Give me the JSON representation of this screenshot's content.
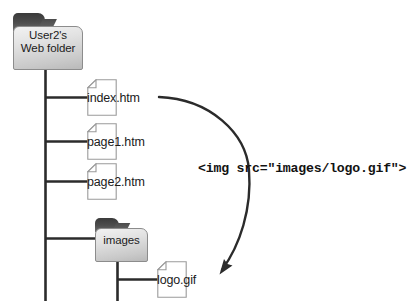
{
  "diagram": {
    "background_color": "#ffffff",
    "line_color": "#2b2b2b",
    "file_outline_color": "#9a9a9a",
    "folder_tab_color": "#4e4e4e",
    "folder_body_color": "#dcdcdc"
  },
  "root_folder": {
    "icon": "folder-icon",
    "label_line1": "User2's",
    "label_line2": "Web folder"
  },
  "files": [
    {
      "icon": "file-icon",
      "label": "index.htm"
    },
    {
      "icon": "file-icon",
      "label": "page1.htm"
    },
    {
      "icon": "file-icon",
      "label": "page2.htm"
    }
  ],
  "images_folder": {
    "icon": "folder-icon",
    "label": "images"
  },
  "image_file": {
    "icon": "file-icon",
    "label": "logo.gif"
  },
  "code": {
    "snippet": "<img src=\"images/logo.gif\">"
  },
  "arrow": {
    "name": "reference-arrow",
    "from": "index.htm",
    "to": "logo.gif",
    "head": "arrowhead-icon"
  }
}
